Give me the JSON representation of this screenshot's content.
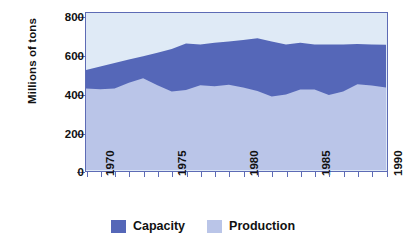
{
  "chart_data": {
    "type": "area",
    "title": "",
    "subtitle": "",
    "xlabel": "",
    "ylabel": "Millions of tons",
    "xlim": [
      1969,
      1990
    ],
    "ylim": [
      0,
      800
    ],
    "grid": false,
    "stacked": false,
    "legend_position": "bottom",
    "x": [
      1969,
      1970,
      1971,
      1972,
      1973,
      1974,
      1975,
      1976,
      1977,
      1978,
      1979,
      1980,
      1981,
      1982,
      1983,
      1984,
      1985,
      1986,
      1987,
      1988,
      1989,
      1990
    ],
    "xticks": [
      1970,
      1975,
      1980,
      1985,
      1990
    ],
    "xticklabels": [
      "1970",
      "1975",
      "1980",
      "1985",
      "1990"
    ],
    "yticks": [
      0,
      200,
      400,
      600,
      800
    ],
    "yticklabels": [
      "0",
      "200",
      "400",
      "600",
      "800"
    ],
    "series": [
      {
        "name": "Capacity",
        "color": "#5567b8",
        "values": [
          510,
          527,
          545,
          563,
          580,
          598,
          617,
          645,
          640,
          648,
          655,
          663,
          671,
          655,
          640,
          648,
          640,
          640,
          640,
          642,
          640,
          638
        ]
      },
      {
        "name": "Production",
        "color": "#bac5e8",
        "values": [
          415,
          412,
          415,
          445,
          468,
          432,
          400,
          408,
          432,
          427,
          435,
          420,
          403,
          375,
          385,
          410,
          410,
          382,
          400,
          437,
          430,
          420
        ]
      }
    ],
    "background_color": "#dfeaf6",
    "frame_color": "#5d6bb5",
    "annotations": []
  },
  "legend": {
    "items": [
      {
        "label": "Capacity",
        "color": "#5567b8"
      },
      {
        "label": "Production",
        "color": "#bac5e8"
      }
    ]
  }
}
